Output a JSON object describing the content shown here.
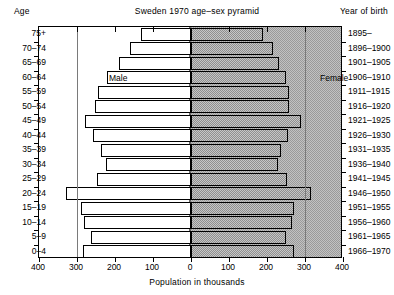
{
  "header": {
    "age_header": "Age",
    "title": "Sweden  1970 age–sex pyramid",
    "yob_header": "Year of birth"
  },
  "series_labels": {
    "male": "Male",
    "female": "Female"
  },
  "axis": {
    "xlabel": "Population in thousands",
    "xticks": [
      "400",
      "300",
      "200",
      "100",
      "0",
      "100",
      "200",
      "300",
      "400"
    ]
  },
  "chart_data": {
    "type": "bar",
    "subtype": "population-pyramid",
    "title": "Sweden  1970 age–sex pyramid",
    "xlabel": "Population in thousands",
    "ylabel": "Age",
    "y2label": "Year of birth",
    "xlim": [
      -400,
      400
    ],
    "xtick_values": [
      -400,
      -300,
      -200,
      -100,
      0,
      100,
      200,
      300,
      400
    ],
    "xtick_labels": [
      "400",
      "300",
      "200",
      "100",
      "0",
      "100",
      "200",
      "300",
      "400"
    ],
    "grid": false,
    "legend": [
      "Male",
      "Female"
    ],
    "legend_position": "in-plot",
    "units": "thousands",
    "categories": [
      "75+",
      "70–74",
      "65–69",
      "60–64",
      "55–59",
      "50–54",
      "45–49",
      "40–44",
      "35–39",
      "30–34",
      "25–29",
      "20–24",
      "15–19",
      "10–14",
      "5–9",
      "0–4"
    ],
    "year_of_birth": [
      "1895–",
      "1896–1900",
      "1901–1905",
      "1906–1910",
      "1911–1915",
      "1916–1920",
      "1921–1925",
      "1926–1930",
      "1931–1935",
      "1936–1940",
      "1941–1945",
      "1946–1950",
      "1951–1955",
      "1956–1960",
      "1961–1965",
      "1966–1970"
    ],
    "series": [
      {
        "name": "Male",
        "side": "left",
        "values": [
          131,
          160,
          190,
          222,
          246,
          252,
          278,
          257,
          237,
          225,
          248,
          330,
          290,
          282,
          262,
          285
        ]
      },
      {
        "name": "Female",
        "side": "right",
        "values": [
          190,
          215,
          232,
          250,
          258,
          258,
          290,
          255,
          238,
          228,
          252,
          315,
          272,
          265,
          250,
          270
        ]
      }
    ]
  }
}
